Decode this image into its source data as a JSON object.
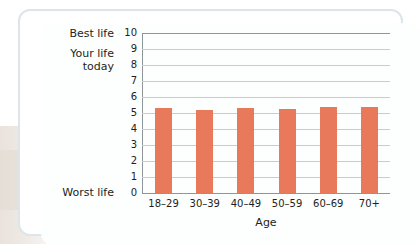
{
  "figure": {
    "y_axis_title_line1": "Your life",
    "y_axis_title_line2": "today",
    "top_caption": "Best life",
    "bottom_caption": "Worst life",
    "x_axis_title": "Age",
    "bar_color": "#E8795A",
    "gridline_color": "#C8CCCE",
    "axis_color": "#8F9699",
    "card_border_color": "#DBE5EA"
  },
  "chart_data": {
    "type": "bar",
    "title": "",
    "xlabel": "Age",
    "ylabel": "Your life today",
    "categories": [
      "18–29",
      "30–39",
      "40–49",
      "50–59",
      "60–69",
      "70+"
    ],
    "values": [
      5.3,
      5.2,
      5.3,
      5.25,
      5.4,
      5.35
    ],
    "ylim": [
      0,
      10
    ],
    "yticks": [
      "10",
      "9",
      "8",
      "7",
      "6",
      "5",
      "4",
      "3",
      "2",
      "1",
      "0"
    ],
    "ytick_values": [
      10,
      9,
      8,
      7,
      6,
      5,
      4,
      3,
      2,
      1,
      0
    ],
    "y_min_annotation": "Worst life",
    "y_max_annotation": "Best life",
    "grid": true,
    "legend": false,
    "series": [
      {
        "name": "Your life today",
        "values": [
          5.3,
          5.2,
          5.3,
          5.25,
          5.4,
          5.35
        ],
        "color": "#E8795A"
      }
    ]
  }
}
